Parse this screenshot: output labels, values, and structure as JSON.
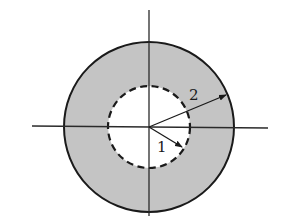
{
  "diagram": {
    "type": "annular cross-section with coordinate axes",
    "center": [
      149,
      127
    ],
    "outer_circle": {
      "radius": 85,
      "fill": "#c4c4c4",
      "stroke": "#1a1a1a",
      "style": "solid"
    },
    "inner_circle": {
      "radius": 41,
      "fill": "#ffffff",
      "stroke": "#1a1a1a",
      "style": "dashed"
    },
    "axes": {
      "horizontal": {
        "x1": 32,
        "x2": 268,
        "y": 127
      },
      "vertical": {
        "x": 149,
        "y1": 10,
        "y2": 216
      }
    },
    "arrows": [
      {
        "label": "1",
        "from": [
          149,
          127
        ],
        "to": [
          182,
          147
        ],
        "label_pos": [
          157,
          152
        ]
      },
      {
        "label": "2",
        "from": [
          149,
          127
        ],
        "to": [
          226,
          95
        ],
        "label_pos": [
          189,
          100
        ]
      }
    ]
  }
}
